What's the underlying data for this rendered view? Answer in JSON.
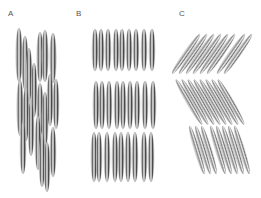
{
  "figure": {
    "panels": [
      {
        "label": "A",
        "label_x": 8,
        "label_y": 10,
        "arrangement": "nematic-disordered"
      },
      {
        "label": "B",
        "label_x": 76,
        "label_y": 10,
        "arrangement": "smectic-A-layers"
      },
      {
        "label": "C",
        "label_x": 179,
        "label_y": 10,
        "arrangement": "smectic-C-tilted-layers"
      }
    ],
    "colors": {
      "background": "#ffffff",
      "rod_dark": "#4a4a4a",
      "rod_mid": "#8a8a8a",
      "rod_light": "#e6e6e6",
      "label": "#555555"
    },
    "rods": {
      "A": [
        {
          "cx": 19,
          "cy": 55,
          "rx": 3.2,
          "ry": 27,
          "angle": 0
        },
        {
          "cx": 25,
          "cy": 63,
          "rx": 3.2,
          "ry": 27,
          "angle": 0
        },
        {
          "cx": 29,
          "cy": 75,
          "rx": 3.0,
          "ry": 27,
          "angle": 0
        },
        {
          "cx": 34,
          "cy": 90,
          "rx": 3.0,
          "ry": 27,
          "angle": 0
        },
        {
          "cx": 40,
          "cy": 57,
          "rx": 3.2,
          "ry": 25,
          "angle": 0
        },
        {
          "cx": 45,
          "cy": 56,
          "rx": 3.2,
          "ry": 26,
          "angle": 0
        },
        {
          "cx": 53,
          "cy": 58,
          "rx": 3.2,
          "ry": 25,
          "angle": 0
        },
        {
          "cx": 20,
          "cy": 108,
          "rx": 3.2,
          "ry": 28,
          "angle": 0
        },
        {
          "cx": 26,
          "cy": 114,
          "rx": 3.0,
          "ry": 27,
          "angle": 0
        },
        {
          "cx": 31,
          "cy": 128,
          "rx": 3.0,
          "ry": 28,
          "angle": 0
        },
        {
          "cx": 40,
          "cy": 110,
          "rx": 3.2,
          "ry": 27,
          "angle": 0
        },
        {
          "cx": 45,
          "cy": 120,
          "rx": 3.2,
          "ry": 28,
          "angle": 0
        },
        {
          "cx": 50,
          "cy": 100,
          "rx": 3.0,
          "ry": 26,
          "angle": 0
        },
        {
          "cx": 56,
          "cy": 104,
          "rx": 3.0,
          "ry": 25,
          "angle": 0
        },
        {
          "cx": 23,
          "cy": 148,
          "rx": 3.0,
          "ry": 26,
          "angle": 0
        },
        {
          "cx": 38,
          "cy": 143,
          "rx": 3.0,
          "ry": 27,
          "angle": 0
        },
        {
          "cx": 42,
          "cy": 160,
          "rx": 3.0,
          "ry": 27,
          "angle": 0
        },
        {
          "cx": 47,
          "cy": 167,
          "rx": 3.0,
          "ry": 25,
          "angle": 0
        },
        {
          "cx": 53,
          "cy": 152,
          "rx": 3.0,
          "ry": 25,
          "angle": 0
        }
      ],
      "B": [
        {
          "cx": 95,
          "cy": 50,
          "rx": 3.0,
          "ry": 21,
          "angle": 0
        },
        {
          "cx": 101,
          "cy": 50,
          "rx": 3.0,
          "ry": 21,
          "angle": 0
        },
        {
          "cx": 108,
          "cy": 50,
          "rx": 3.0,
          "ry": 21,
          "angle": 0
        },
        {
          "cx": 116,
          "cy": 50,
          "rx": 3.0,
          "ry": 21,
          "angle": 0
        },
        {
          "cx": 122,
          "cy": 50,
          "rx": 3.0,
          "ry": 21,
          "angle": 0
        },
        {
          "cx": 129,
          "cy": 50,
          "rx": 3.0,
          "ry": 21,
          "angle": 0
        },
        {
          "cx": 136,
          "cy": 50,
          "rx": 3.0,
          "ry": 21,
          "angle": 0
        },
        {
          "cx": 144,
          "cy": 50,
          "rx": 3.0,
          "ry": 21,
          "angle": 0
        },
        {
          "cx": 152,
          "cy": 50,
          "rx": 3.0,
          "ry": 21,
          "angle": 0
        },
        {
          "cx": 96,
          "cy": 105,
          "rx": 3.0,
          "ry": 24,
          "angle": 0
        },
        {
          "cx": 102,
          "cy": 105,
          "rx": 3.0,
          "ry": 24,
          "angle": 0
        },
        {
          "cx": 109,
          "cy": 105,
          "rx": 3.0,
          "ry": 24,
          "angle": 0
        },
        {
          "cx": 117,
          "cy": 105,
          "rx": 3.0,
          "ry": 24,
          "angle": 0
        },
        {
          "cx": 123,
          "cy": 105,
          "rx": 3.0,
          "ry": 24,
          "angle": 0
        },
        {
          "cx": 130,
          "cy": 105,
          "rx": 3.0,
          "ry": 24,
          "angle": 0
        },
        {
          "cx": 137,
          "cy": 105,
          "rx": 3.0,
          "ry": 24,
          "angle": 0
        },
        {
          "cx": 145,
          "cy": 105,
          "rx": 3.0,
          "ry": 24,
          "angle": 0
        },
        {
          "cx": 153,
          "cy": 105,
          "rx": 3.0,
          "ry": 24,
          "angle": 0
        },
        {
          "cx": 94,
          "cy": 157,
          "rx": 3.0,
          "ry": 25,
          "angle": 0
        },
        {
          "cx": 99,
          "cy": 157,
          "rx": 3.0,
          "ry": 25,
          "angle": 0
        },
        {
          "cx": 107,
          "cy": 157,
          "rx": 3.0,
          "ry": 25,
          "angle": 0
        },
        {
          "cx": 115,
          "cy": 157,
          "rx": 3.0,
          "ry": 25,
          "angle": 0
        },
        {
          "cx": 121,
          "cy": 157,
          "rx": 3.0,
          "ry": 25,
          "angle": 0
        },
        {
          "cx": 128,
          "cy": 157,
          "rx": 3.0,
          "ry": 25,
          "angle": 0
        },
        {
          "cx": 135,
          "cy": 157,
          "rx": 3.0,
          "ry": 25,
          "angle": 0
        },
        {
          "cx": 144,
          "cy": 157,
          "rx": 3.0,
          "ry": 25,
          "angle": 0
        },
        {
          "cx": 151,
          "cy": 157,
          "rx": 3.0,
          "ry": 25,
          "angle": 0
        }
      ],
      "C": [
        {
          "cx": 186,
          "cy": 54,
          "rx": 2.6,
          "ry": 24,
          "angle": 35
        },
        {
          "cx": 193,
          "cy": 54,
          "rx": 2.6,
          "ry": 24,
          "angle": 35
        },
        {
          "cx": 200,
          "cy": 54,
          "rx": 2.6,
          "ry": 24,
          "angle": 35
        },
        {
          "cx": 207,
          "cy": 54,
          "rx": 2.6,
          "ry": 24,
          "angle": 35
        },
        {
          "cx": 214,
          "cy": 54,
          "rx": 2.6,
          "ry": 24,
          "angle": 35
        },
        {
          "cx": 221,
          "cy": 54,
          "rx": 2.6,
          "ry": 24,
          "angle": 35
        },
        {
          "cx": 231,
          "cy": 54,
          "rx": 2.6,
          "ry": 24,
          "angle": 35
        },
        {
          "cx": 238,
          "cy": 54,
          "rx": 2.6,
          "ry": 24,
          "angle": 35
        },
        {
          "cx": 189,
          "cy": 102,
          "rx": 2.6,
          "ry": 26,
          "angle": -30
        },
        {
          "cx": 195,
          "cy": 102,
          "rx": 2.6,
          "ry": 26,
          "angle": -30
        },
        {
          "cx": 201,
          "cy": 102,
          "rx": 2.6,
          "ry": 26,
          "angle": -30
        },
        {
          "cx": 207,
          "cy": 102,
          "rx": 2.6,
          "ry": 26,
          "angle": -30
        },
        {
          "cx": 213,
          "cy": 102,
          "rx": 2.6,
          "ry": 26,
          "angle": -30
        },
        {
          "cx": 219,
          "cy": 102,
          "rx": 2.6,
          "ry": 26,
          "angle": -30
        },
        {
          "cx": 225,
          "cy": 102,
          "rx": 2.6,
          "ry": 26,
          "angle": -30
        },
        {
          "cx": 231,
          "cy": 102,
          "rx": 2.6,
          "ry": 26,
          "angle": -30
        },
        {
          "cx": 197,
          "cy": 150,
          "rx": 2.6,
          "ry": 25,
          "angle": -17
        },
        {
          "cx": 203,
          "cy": 150,
          "rx": 2.6,
          "ry": 25,
          "angle": -17
        },
        {
          "cx": 209,
          "cy": 150,
          "rx": 2.6,
          "ry": 25,
          "angle": -17
        },
        {
          "cx": 218,
          "cy": 150,
          "rx": 2.6,
          "ry": 25,
          "angle": -17
        },
        {
          "cx": 224,
          "cy": 150,
          "rx": 2.6,
          "ry": 25,
          "angle": -17
        },
        {
          "cx": 230,
          "cy": 150,
          "rx": 2.6,
          "ry": 25,
          "angle": -17
        },
        {
          "cx": 236,
          "cy": 150,
          "rx": 2.6,
          "ry": 25,
          "angle": -17
        },
        {
          "cx": 242,
          "cy": 150,
          "rx": 2.6,
          "ry": 25,
          "angle": -17
        }
      ]
    }
  }
}
